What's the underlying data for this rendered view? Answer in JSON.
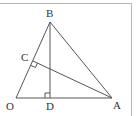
{
  "diagram": {
    "type": "geometry",
    "points": {
      "O": {
        "label": "O",
        "x": 16,
        "y": 98
      },
      "A": {
        "label": "A",
        "x": 112,
        "y": 98
      },
      "B": {
        "label": "B",
        "x": 50,
        "y": 22
      },
      "C": {
        "label": "C",
        "x": 33,
        "y": 61
      },
      "D": {
        "label": "D",
        "x": 50,
        "y": 98
      }
    },
    "segments": [
      "OA",
      "OB",
      "AB",
      "BD",
      "AC"
    ],
    "right_angles": [
      "BDO",
      "ACO"
    ],
    "colors": {
      "line": "#555555",
      "border": "#b8b8b8",
      "text": "#333333"
    }
  }
}
